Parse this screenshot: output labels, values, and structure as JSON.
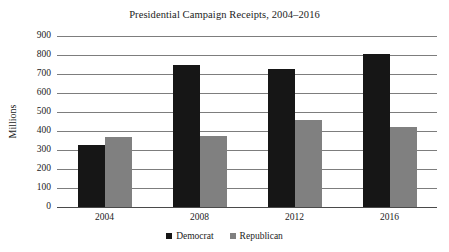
{
  "chart_data": {
    "type": "bar",
    "title": "Presidential Campaign Receipts, 2004–2016",
    "xlabel": "",
    "ylabel": "Millions",
    "categories": [
      "2004",
      "2008",
      "2012",
      "2016"
    ],
    "series": [
      {
        "name": "Democrat",
        "color": "#161616",
        "values": [
          325,
          745,
          725,
          805
        ]
      },
      {
        "name": "Republican",
        "color": "#808080",
        "values": [
          367,
          372,
          456,
          420
        ]
      }
    ],
    "ylim": [
      0,
      900
    ],
    "ytick_step": 100,
    "yticks": [
      "900",
      "800",
      "700",
      "600",
      "500",
      "400",
      "300",
      "200",
      "100",
      "0"
    ],
    "grid": true,
    "grid_axis": "y",
    "legend_position": "bottom-center"
  },
  "legend": {
    "items": [
      {
        "label": "Democrat",
        "marker": "filled-square-dark"
      },
      {
        "label": "Republican",
        "marker": "filled-square-gray"
      }
    ]
  }
}
